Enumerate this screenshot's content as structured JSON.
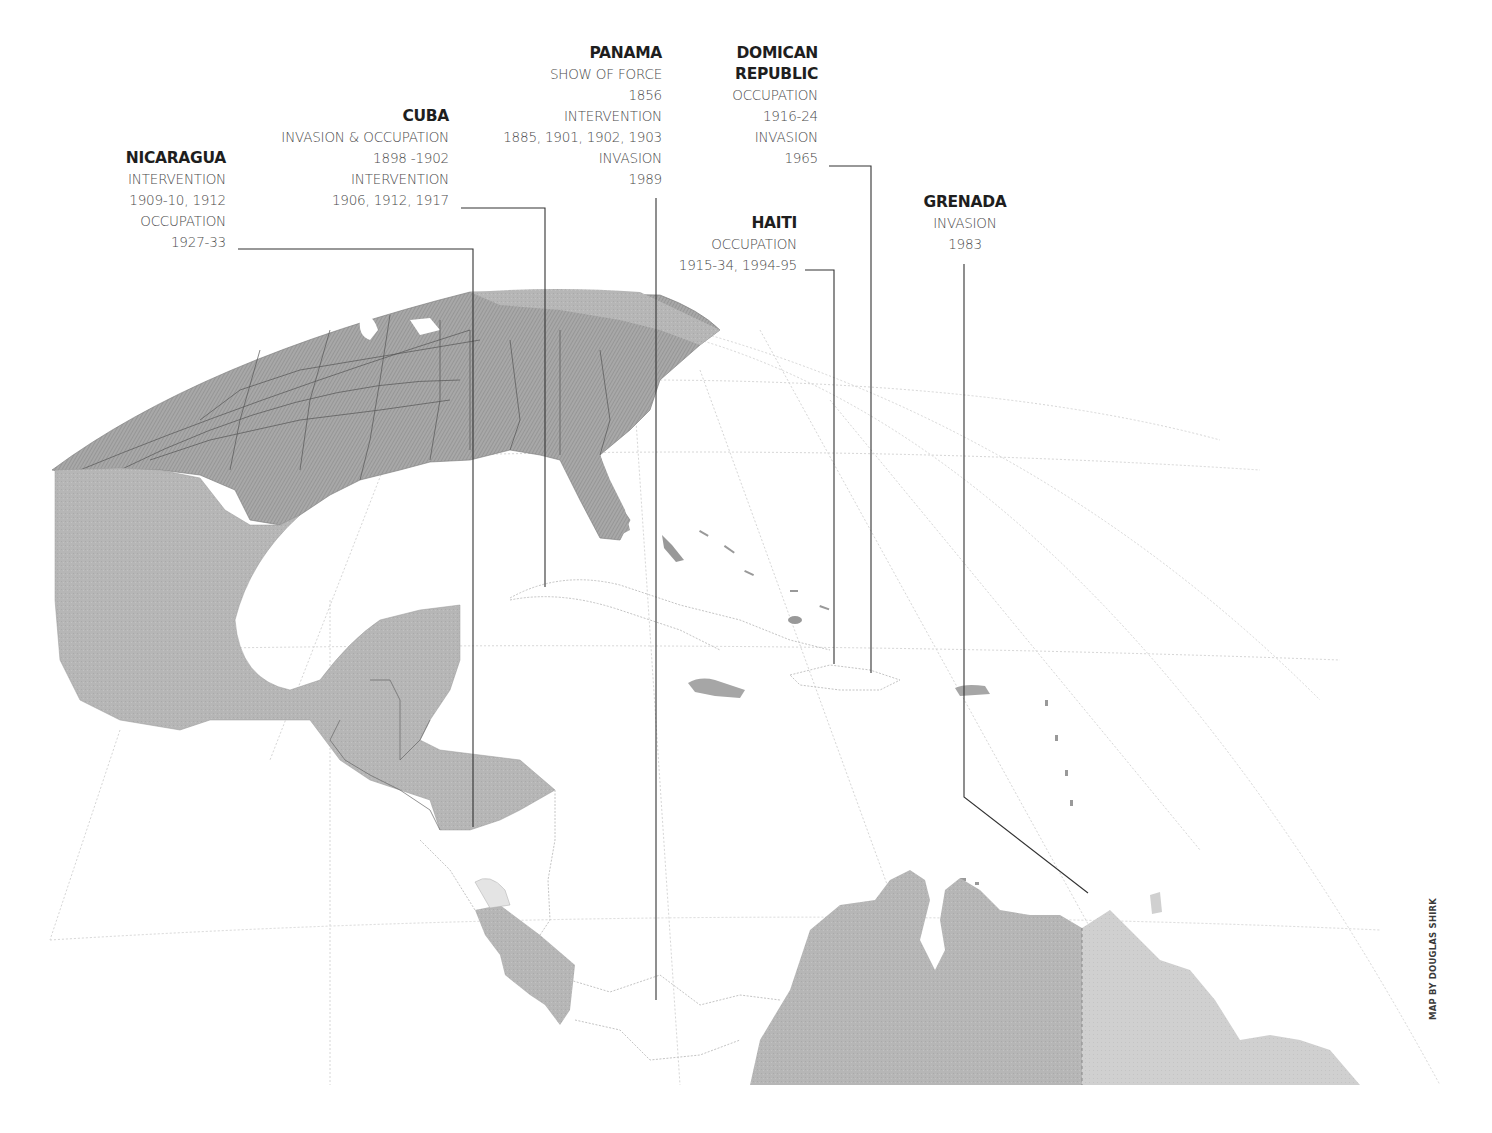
{
  "map": {
    "title": "U.S. interventions in the Caribbean and Central America",
    "colors": {
      "usa": "#9a9a9a",
      "land_dark": "#b4b4b4",
      "land_light": "#cfcfcf",
      "ocean": "#ffffff",
      "graticule": "#d8d8d8",
      "leader": "#333333"
    },
    "labels": {
      "nicaragua": {
        "country": "NICARAGUA",
        "lines": [
          "INTERVENTION",
          "1909-10, 1912",
          "OCCUPATION",
          "1927-33"
        ]
      },
      "cuba": {
        "country": "CUBA",
        "lines": [
          "INVASION & OCCUPATION",
          "1898 -1902",
          "INTERVENTION",
          "1906, 1912, 1917"
        ]
      },
      "panama": {
        "country": "PANAMA",
        "lines": [
          "SHOW OF FORCE",
          "1856",
          "INTERVENTION",
          "1885, 1901, 1902, 1903",
          "INVASION",
          "1989"
        ]
      },
      "dominican_republic": {
        "country_line1": "DOMICAN",
        "country_line2": "REPUBLIC",
        "lines": [
          "OCCUPATION",
          "1916-24",
          "INVASION",
          "1965"
        ]
      },
      "haiti": {
        "country": "HAITI",
        "lines": [
          "OCCUPATION",
          "1915-34, 1994-95"
        ]
      },
      "grenada": {
        "country": "GRENADA",
        "lines": [
          "INVASION",
          "1983"
        ]
      }
    },
    "credit": "MAP BY DOUGLAS SHIRK"
  }
}
